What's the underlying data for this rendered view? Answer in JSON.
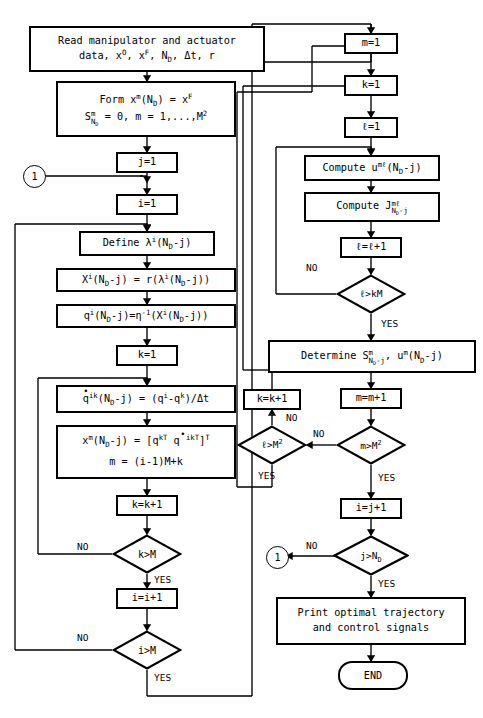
{
  "diagram": {
    "labels": {
      "yes": "YES",
      "no": "NO",
      "connector": "1",
      "end": "END"
    },
    "nodes": {
      "read_data": {
        "type": "process",
        "line1": "Read manipulator and actuator",
        "line2_a": "data, x",
        "line2_sup1": "O",
        "line2_b": ", x",
        "line2_sup2": "F",
        "line2_c": ", N",
        "line2_sub1": "D",
        "line2_d": ", Δt, r",
        "text": "Read manipulator and actuator data, x^O, x^F, N_D, Δt, r"
      },
      "form_x": {
        "type": "process",
        "line1_a": "Form x",
        "line1_sup": "m",
        "line1_b": "(N",
        "line1_sub": "D",
        "line1_c": ") = x",
        "line1_sup2": "F",
        "line2_a": "S",
        "line2_stack_top": "m",
        "line2_stack_bot": "N",
        "line2_stack_bot2": "D",
        "line2_b": " = 0, m = 1,...,M",
        "line2_sup": "2",
        "text": "Form x^m(N_D) = x^F ; S^m_{N_D} = 0, m = 1,...,M^2"
      },
      "j_init": {
        "type": "process",
        "text": "j=1"
      },
      "i_init": {
        "type": "process",
        "text": "i=1"
      },
      "define_lambda": {
        "type": "process",
        "a": "Define λ",
        "sup": "i",
        "b": "(N",
        "sub": "D",
        "c": "-j)",
        "text": "Define λ^i(N_D-j)"
      },
      "compute_X": {
        "type": "process",
        "a": "X",
        "sup1": "i",
        "b": "(N",
        "sub1": "D",
        "c": "-j) = r(λ",
        "sup2": "i",
        "d": "(N",
        "sub2": "D",
        "e": "-j))",
        "text": "X^i(N_D-j) = r(λ^i(N_D-j))"
      },
      "compute_q": {
        "a": "q",
        "sup1": "i",
        "b": "(N",
        "sub1": "D",
        "c": "-j)=η",
        "sup2": "-1",
        "d": "(X",
        "sup3": "i",
        "e": "(N",
        "sub2": "D",
        "f": "-j))",
        "text": "q^i(N_D-j)=η^-1(X^i(N_D-j))"
      },
      "k_init": {
        "type": "process",
        "text": "k=1"
      },
      "qdot": {
        "a": "q",
        "sup1": "ik",
        "b": "(N",
        "sub1": "D",
        "c": "-j) = (q",
        "sup2": "i",
        "d": "-q",
        "sup3": "k",
        "e": ")/Δt",
        "text": "q̇^ik(N_D-j) = (q^i-q^k)/Δt"
      },
      "xm_assemble": {
        "l1_a": "x",
        "l1_sup1": "m",
        "l1_b": "(N",
        "l1_sub": "D",
        "l1_c": "-j) = [q",
        "l1_sup2": "kT",
        "l1_d": " q",
        "l1_sup3": "ikT",
        "l1_e": "]",
        "l1_sup4": "T",
        "l2": "m = (i-1)M+k",
        "text": "x^m(N_D-j) = [q^kT q̇^ikT]^T ; m = (i-1)M+k"
      },
      "k_incr_left": {
        "type": "process",
        "text": "k=k+1"
      },
      "dec_k_gt_M": {
        "type": "decision",
        "a": "k>M",
        "text": "k>M"
      },
      "i_incr": {
        "type": "process",
        "text": "i=i+1"
      },
      "dec_i_gt_M": {
        "type": "decision",
        "a": "i>M",
        "text": "i>M"
      },
      "m_init": {
        "type": "process",
        "text": "m=1"
      },
      "k_init_right": {
        "type": "process",
        "text": "k=1"
      },
      "l_init": {
        "type": "process",
        "text": "ℓ=1"
      },
      "compute_u": {
        "a": "Compute u",
        "sup": "mℓ",
        "b": "(N",
        "sub": "D",
        "c": "-j)",
        "text": "Compute u^mℓ(N_D-j)"
      },
      "compute_J": {
        "a": "Compute J",
        "stack_top": "mℓ",
        "stack_bot": "N",
        "stack_bot2": "D",
        "stack_bot3": "-j",
        "text": "Compute J^{mℓ}_{N_D-j}"
      },
      "l_incr": {
        "type": "process",
        "text": "ℓ=ℓ+1"
      },
      "dec_l_gt_kM": {
        "type": "decision",
        "a": "ℓ>kM",
        "text": "ℓ>kM"
      },
      "determine_S": {
        "a": "Determine S",
        "stack_top": "m",
        "stack_bot": "N",
        "stack_bot2": "D",
        "stack_bot3": "-j",
        "b": ", u",
        "sup": "m",
        "c": "(N",
        "sub": "D",
        "d": "-j)",
        "text": "Determine S^m_{N_D-j}, u^m(N_D-j)"
      },
      "k_incr_right": {
        "type": "process",
        "text": "k=k+1"
      },
      "m_incr": {
        "type": "process",
        "text": "m=m+1"
      },
      "dec_l_gt_M2": {
        "type": "decision",
        "a": "ℓ>M",
        "sup": "2",
        "text": "ℓ>M²"
      },
      "dec_m_gt_M2": {
        "type": "decision",
        "a": "m>M",
        "sup": "2",
        "text": "m>M²"
      },
      "j_incr": {
        "type": "process",
        "text": "i=j+1"
      },
      "dec_j_gt_ND": {
        "type": "decision",
        "a": "j>N",
        "sub": "D",
        "text": "j>N_D"
      },
      "print_result": {
        "line1": "Print optimal trajectory",
        "line2": "and control signals",
        "text": "Print optimal trajectory and control signals"
      },
      "end_node": {
        "type": "terminator",
        "text": "END"
      }
    },
    "edge_labels": [
      {
        "id": "lbl-no-lkM",
        "text": "NO"
      },
      {
        "id": "lbl-yes-lkM",
        "text": "YES"
      },
      {
        "id": "lbl-no-kM",
        "text": "NO"
      },
      {
        "id": "lbl-yes-kM",
        "text": "YES"
      },
      {
        "id": "lbl-no-iM",
        "text": "NO"
      },
      {
        "id": "lbl-yes-iM",
        "text": "YES"
      },
      {
        "id": "lbl-no-lM2",
        "text": "NO"
      },
      {
        "id": "lbl-yes-lM2",
        "text": "YES"
      },
      {
        "id": "lbl-no-mM2",
        "text": "NO"
      },
      {
        "id": "lbl-yes-mM2",
        "text": "YES"
      },
      {
        "id": "lbl-no-jND",
        "text": "NO"
      },
      {
        "id": "lbl-yes-jND",
        "text": "YES"
      }
    ],
    "colors": {
      "stroke": "#000000",
      "fill": "#ffffff"
    }
  }
}
